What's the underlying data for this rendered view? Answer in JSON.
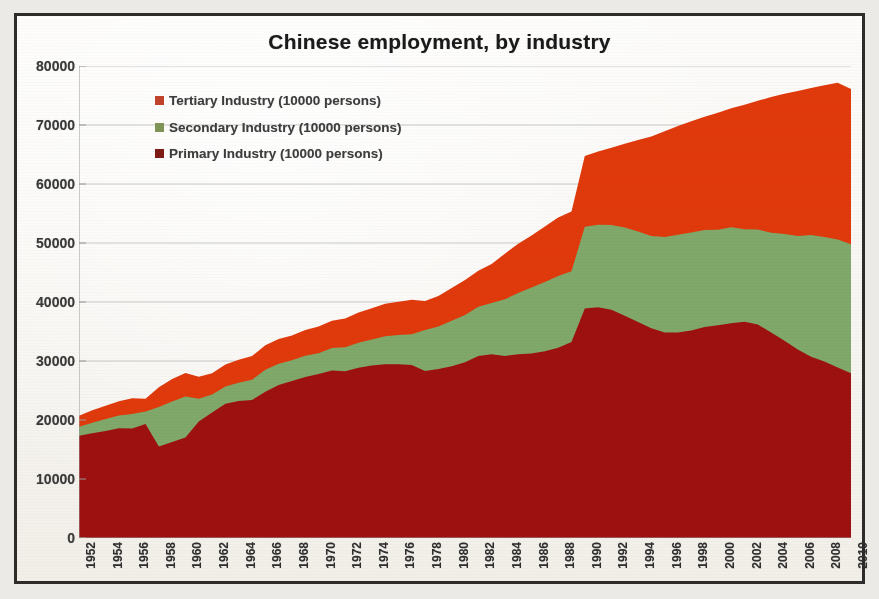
{
  "chart_data": {
    "type": "area",
    "stacked": true,
    "title": "Chinese employment, by industry",
    "xlabel": "",
    "ylabel": "",
    "ylim": [
      0,
      80000
    ],
    "ytick_step": 10000,
    "yticks": [
      "0",
      "10000",
      "20000",
      "30000",
      "40000",
      "50000",
      "60000",
      "70000",
      "80000"
    ],
    "grid": true,
    "legend_position": "top-left-inside",
    "xtick_label_rotation": 90,
    "xtick_label_interval": 2,
    "x": [
      1952,
      1953,
      1954,
      1955,
      1956,
      1957,
      1958,
      1959,
      1960,
      1961,
      1962,
      1963,
      1964,
      1965,
      1966,
      1967,
      1968,
      1969,
      1970,
      1971,
      1972,
      1973,
      1974,
      1975,
      1976,
      1977,
      1978,
      1979,
      1980,
      1981,
      1982,
      1983,
      1984,
      1985,
      1986,
      1987,
      1988,
      1989,
      1990,
      1991,
      1992,
      1993,
      1994,
      1995,
      1996,
      1997,
      1998,
      1999,
      2000,
      2001,
      2002,
      2003,
      2004,
      2005,
      2006,
      2007,
      2008,
      2009,
      2010
    ],
    "xtick_labels": [
      "1952",
      "1954",
      "1956",
      "1958",
      "1960",
      "1962",
      "1964",
      "1966",
      "1968",
      "1970",
      "1972",
      "1974",
      "1976",
      "1978",
      "1980",
      "1982",
      "1984",
      "1986",
      "1988",
      "1990",
      "1992",
      "1994",
      "1996",
      "1998",
      "2000",
      "2002",
      "2004",
      "2006",
      "2008",
      "2010"
    ],
    "series": [
      {
        "name": "Primary Industry (10000 persons)",
        "color": "#9E1111",
        "legend_marker_color": "#7E1B14",
        "values": [
          17317,
          17747,
          18151,
          18592,
          18544,
          19310,
          15490,
          16271,
          17016,
          19747,
          21276,
          22736,
          23217,
          23396,
          24797,
          25913,
          26613,
          27270,
          27811,
          28397,
          28283,
          28857,
          29218,
          29456,
          29443,
          29340,
          28318,
          28634,
          29122,
          29777,
          30859,
          31151,
          30868,
          31130,
          31254,
          31663,
          32249,
          33225,
          38914,
          39098,
          38699,
          37680,
          36628,
          35530,
          34820,
          34840,
          35177,
          35768,
          36043,
          36399,
          36640,
          36204,
          34830,
          33442,
          31941,
          30731,
          29923,
          28890,
          27931
        ]
      },
      {
        "name": "Secondary Industry (10000 persons)",
        "color": "#7FA86A",
        "legend_marker_color": "#7F9556",
        "values": [
          1531,
          1805,
          1998,
          2167,
          2487,
          2142,
          6709,
          6882,
          6979,
          3837,
          3061,
          2940,
          3094,
          3408,
          3735,
          3618,
          3504,
          3628,
          3518,
          3786,
          4037,
          4251,
          4419,
          4729,
          4962,
          5194,
          6945,
          7214,
          7707,
          8003,
          8346,
          8679,
          9590,
          10384,
          11216,
          11726,
          12152,
          11976,
          13856,
          14015,
          14355,
          14965,
          15312,
          15655,
          16203,
          16547,
          16600,
          16421,
          16219,
          16284,
          15682,
          16077,
          16920,
          18084,
          19225,
          20629,
          21109,
          21684,
          21842
        ]
      },
      {
        "name": "Tertiary Industry (10000 persons)",
        "color": "#E03A0C",
        "legend_marker_color": "#C0432B",
        "values": [
          1881,
          2111,
          2270,
          2412,
          2665,
          2142,
          3346,
          3796,
          3985,
          3735,
          3605,
          3720,
          3891,
          4048,
          4146,
          4184,
          4214,
          4362,
          4508,
          4648,
          4891,
          5106,
          5324,
          5507,
          5652,
          5859,
          4890,
          5177,
          5532,
          5945,
          6090,
          6606,
          7739,
          8359,
          8811,
          9395,
          9933,
          10129,
          11979,
          12378,
          13098,
          14163,
          15515,
          16880,
          17927,
          18432,
          18860,
          19205,
          19823,
          20165,
          21090,
          21809,
          23011,
          23771,
          24614,
          24917,
          25717,
          26603,
          26332
        ]
      }
    ],
    "totals_note": "Primary + Secondary + Tertiary stacked; 2010 total ≈ 76105"
  },
  "legend": [
    {
      "label": "Tertiary Industry (10000 persons)",
      "color": "#C0432B"
    },
    {
      "label": "Secondary Industry (10000 persons)",
      "color": "#7F9556"
    },
    {
      "label": "Primary Industry (10000 persons)",
      "color": "#7E1B14"
    }
  ],
  "style": {
    "title_color": "#1a1a1a",
    "axis_label_color": "#3a3a3a",
    "grid_color": "#c8c8c8",
    "axis_color": "#9a9a9a",
    "page_background": "#eceae6",
    "paper_background": "#fbfaf8",
    "frame_color": "#2e2c2a",
    "primary_color": "#9E1111",
    "secondary_color": "#7FA86A",
    "tertiary_color": "#E03A0C"
  }
}
